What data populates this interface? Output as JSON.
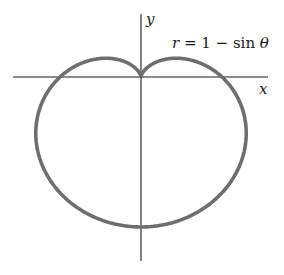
{
  "diagram": {
    "type": "polar-curve",
    "equation_label": "r = 1 − sin θ",
    "equation_parts": {
      "lhs": "r",
      "eq": " = 1 − sin ",
      "theta": "θ"
    },
    "axes": {
      "x_label": "x",
      "y_label": "y"
    },
    "curve": {
      "name": "cardioid",
      "function": "r = 1 - sin(theta)",
      "stroke_color": "#6e6e6e"
    },
    "axis_color": "#1a1a1a",
    "background": "#ffffff"
  }
}
